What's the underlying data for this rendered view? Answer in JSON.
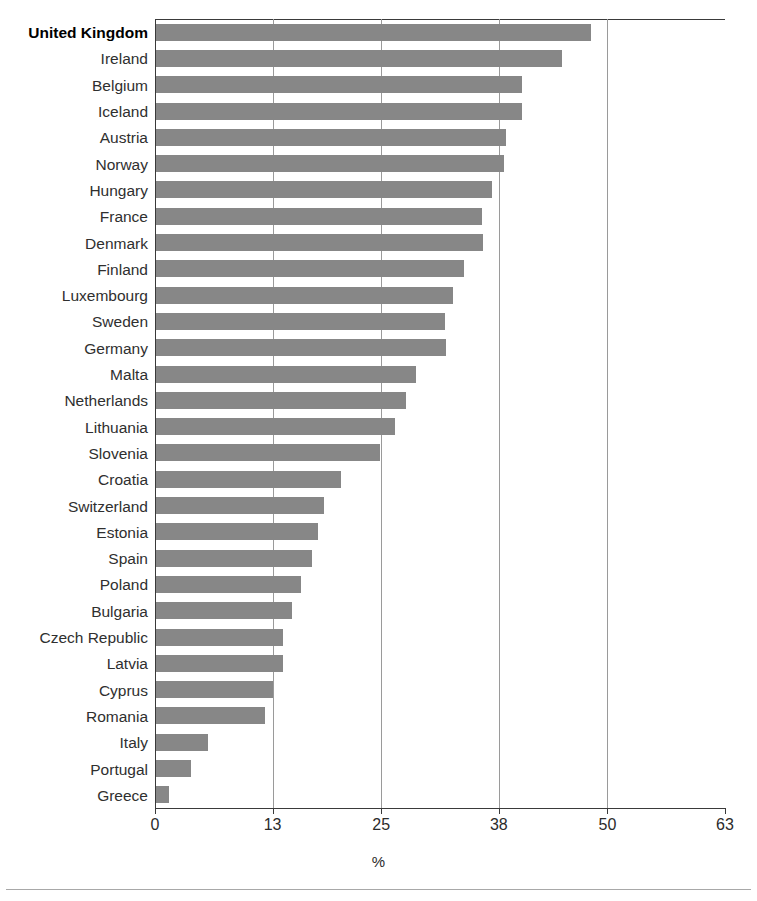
{
  "chart_data": {
    "type": "bar",
    "orientation": "horizontal",
    "title": "",
    "subtitle": "",
    "xlabel": "%",
    "ylabel": "",
    "xlim": [
      0,
      63
    ],
    "xticks": [
      0,
      13,
      25,
      38,
      50,
      63
    ],
    "xtick_labels": [
      "0",
      "13",
      "25",
      "38",
      "50",
      "63"
    ],
    "gridlines": [
      13,
      25,
      38,
      50
    ],
    "grid": true,
    "legend": null,
    "bar_color": "#878787",
    "highlight_category": "United Kingdom",
    "categories": [
      "United Kingdom",
      "Ireland",
      "Belgium",
      "Iceland",
      "Austria",
      "Norway",
      "Hungary",
      "France",
      "Denmark",
      "Finland",
      "Luxembourg",
      "Sweden",
      "Germany",
      "Malta",
      "Netherlands",
      "Lithuania",
      "Slovenia",
      "Croatia",
      "Switzerland",
      "Estonia",
      "Spain",
      "Poland",
      "Bulgaria",
      "Czech Republic",
      "Latvia",
      "Cyprus",
      "Romania",
      "Italy",
      "Portugal",
      "Greece"
    ],
    "values": [
      48.2,
      45.0,
      40.6,
      40.6,
      38.8,
      38.6,
      37.3,
      36.1,
      36.3,
      34.1,
      32.9,
      32.0,
      32.2,
      28.8,
      27.7,
      26.5,
      24.9,
      20.6,
      18.7,
      18.0,
      17.3,
      16.1,
      15.1,
      14.2,
      14.2,
      13.0,
      12.2,
      5.9,
      4.0,
      1.6
    ]
  }
}
